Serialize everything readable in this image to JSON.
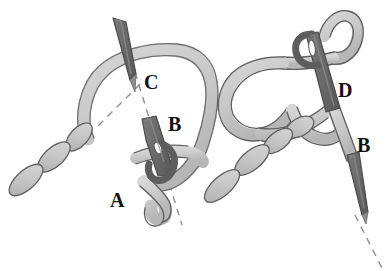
{
  "figure": {
    "domain_kind": "line-drawing illustration",
    "canvas": {
      "width": 388,
      "height": 271,
      "background": "#ffffff"
    },
    "palette": {
      "cord_fill": "#c9c9c9",
      "cord_stroke": "#5a5a5a",
      "needle_fill": "#6e6e6e",
      "needle_stroke": "#4a4a4a",
      "needle_tip_fill": "#7a7a7a",
      "dashed_line": "#8a8a8a",
      "label_color": "#111111",
      "background": "#ffffff"
    },
    "panels": [
      {
        "id": "left-panel",
        "name": "stage-one",
        "labels": [
          {
            "key": "C",
            "text": "C",
            "x": 144,
            "y": 72
          },
          {
            "key": "B",
            "text": "B",
            "x": 168,
            "y": 114
          },
          {
            "key": "A",
            "text": "A",
            "x": 110,
            "y": 190
          }
        ]
      },
      {
        "id": "right-panel",
        "name": "stage-two",
        "labels": [
          {
            "key": "D",
            "text": "D",
            "x": 338,
            "y": 80
          },
          {
            "key": "B",
            "text": "B",
            "x": 357,
            "y": 135
          }
        ]
      }
    ],
    "elements": {
      "cord_loop_label": "suture cord loop",
      "chain_label": "braided cord segments",
      "needle_label": "needle shaft",
      "needle_eye_label": "needle eye loop",
      "dashed_label": "dashed guide axis"
    }
  }
}
